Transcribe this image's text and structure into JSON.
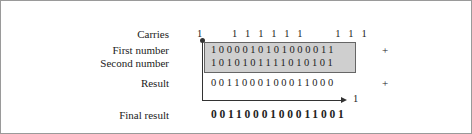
{
  "labels": {
    "carries": "Carries",
    "first": "First number",
    "second": "Second number",
    "result": "Result",
    "final": "Final result"
  },
  "values": {
    "carry_out": "1",
    "carries": "  111111    111  ",
    "first": "1000010101000011",
    "second": "1010101111010101",
    "result": "0011000100011000",
    "wrap_carry": "1",
    "final": "0011000100011001"
  },
  "operators": {
    "plus1": "+",
    "plus2": "+"
  }
}
